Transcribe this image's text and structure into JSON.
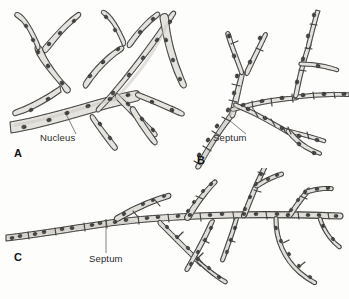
{
  "figure": {
    "background_color": "#fdfdfc",
    "ink_color": "#2b2926",
    "cytoplasm_color": "#e9e7e2",
    "nucleus_color": "#1b1917",
    "panels": [
      {
        "id": "A",
        "letter": "A",
        "letter_x": 14,
        "letter_y": 157,
        "type": "coenocytic aseptate hypha",
        "callout": {
          "text": "Nucleus",
          "label_x": 40,
          "label_y": 141,
          "leader": "M 76 134 L 65 112"
        }
      },
      {
        "id": "B",
        "letter": "B",
        "letter_x": 197,
        "letter_y": 164,
        "type": "septate hypha with one nucleus per cell",
        "callout": {
          "text": "Septum",
          "label_x": 213,
          "label_y": 141,
          "leader": "M 246 134 L 229 120"
        }
      },
      {
        "id": "C",
        "letter": "C",
        "letter_x": 14,
        "letter_y": 261,
        "type": "septate hypha with multiple nuclei per cell",
        "callout": {
          "text": "Septum",
          "label_x": 89,
          "label_y": 262,
          "leader": "M 106 253 L 106 219"
        }
      }
    ]
  }
}
